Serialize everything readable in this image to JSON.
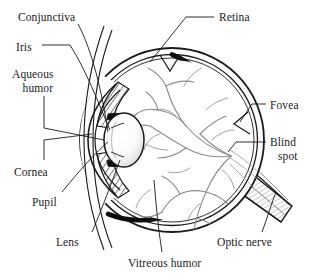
{
  "diagram": {
    "background_color": "#ffffff",
    "ink_color": "#1a1a1a",
    "vessel_color": "#8a8a8a",
    "labels": [
      {
        "id": "conjunctiva",
        "text": "Conjunctiva",
        "line2": "",
        "x": 18,
        "y": 11,
        "leader": "diagonal"
      },
      {
        "id": "iris",
        "text": "Iris",
        "line2": "",
        "x": 16,
        "y": 41,
        "leader": "horizontal-dash"
      },
      {
        "id": "aqueous-humor",
        "text": "Aqueous",
        "line2": "humor",
        "x": 12,
        "y": 68,
        "leader": "elbow"
      },
      {
        "id": "cornea",
        "text": "Cornea",
        "line2": "",
        "x": 14,
        "y": 166,
        "leader": "elbow"
      },
      {
        "id": "pupil",
        "text": "Pupil",
        "line2": "",
        "x": 32,
        "y": 196,
        "leader": "diagonal"
      },
      {
        "id": "lens",
        "text": "Lens",
        "line2": "",
        "x": 56,
        "y": 236,
        "leader": "diagonal"
      },
      {
        "id": "vitreous-humor",
        "text": "Vitreous humor",
        "line2": "",
        "x": 128,
        "y": 257,
        "leader": "diagonal"
      },
      {
        "id": "retina",
        "text": "Retina",
        "line2": "",
        "x": 219,
        "y": 11,
        "leader": "horizontal-dash"
      },
      {
        "id": "fovea",
        "text": "Fovea",
        "line2": "",
        "x": 270,
        "y": 99,
        "leader": "horizontal-dash"
      },
      {
        "id": "blind-spot",
        "text": "Blind",
        "line2": "spot",
        "x": 270,
        "y": 136,
        "leader": "horizontal-dash"
      },
      {
        "id": "optic-nerve",
        "text": "Optic nerve",
        "line2": "",
        "x": 217,
        "y": 236,
        "leader": "diagonal"
      }
    ],
    "structures": [
      {
        "id": "sclera",
        "name": "sclera-outer-wall"
      },
      {
        "id": "choroid",
        "name": "choroid-retina-band"
      },
      {
        "id": "cornea-arc",
        "name": "cornea-arc"
      },
      {
        "id": "conjunctiva-layer",
        "name": "conjunctiva-layer"
      },
      {
        "id": "lens-body",
        "name": "lens-body"
      },
      {
        "id": "iris-wedges",
        "name": "iris-wedges"
      },
      {
        "id": "ciliary-body",
        "name": "ciliary-body-hatching"
      },
      {
        "id": "vessels",
        "name": "retinal-blood-vessels"
      },
      {
        "id": "optic-nerve-band",
        "name": "optic-nerve-band"
      },
      {
        "id": "fovea-marker",
        "name": "fovea-arrowhead"
      },
      {
        "id": "retina-marker",
        "name": "retina-arrowhead"
      }
    ]
  }
}
